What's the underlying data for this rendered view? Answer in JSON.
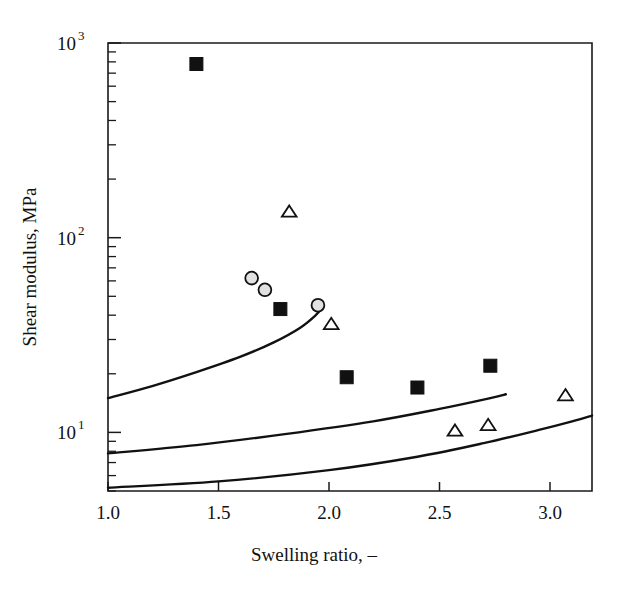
{
  "chart_data": {
    "type": "scatter",
    "title": "",
    "xlabel": "Swelling ratio, –",
    "ylabel": "Shear modulus, MPa",
    "xscale": "linear",
    "yscale": "log",
    "xlim": [
      1.0,
      3.19
    ],
    "ylim": [
      5.0,
      1000
    ],
    "grid": false,
    "legend": "none",
    "xticks": [
      {
        "value": 1.0,
        "label": "1.0"
      },
      {
        "value": 1.5,
        "label": "1.5"
      },
      {
        "value": 2.0,
        "label": "2.0"
      },
      {
        "value": 2.5,
        "label": "2.5"
      },
      {
        "value": 3.0,
        "label": "3.0"
      }
    ],
    "yticks": [
      {
        "value": 10,
        "mantissa": "10",
        "exponent": "1"
      },
      {
        "value": 100,
        "mantissa": "10",
        "exponent": "2"
      },
      {
        "value": 1000,
        "mantissa": "10",
        "exponent": "3"
      }
    ],
    "series": [
      {
        "name": "filled-squares",
        "marker": "filled-square",
        "points": [
          {
            "x": 1.4,
            "y": 780
          },
          {
            "x": 1.78,
            "y": 43
          },
          {
            "x": 2.08,
            "y": 19.2
          },
          {
            "x": 2.4,
            "y": 17.0
          },
          {
            "x": 2.73,
            "y": 22.0
          }
        ]
      },
      {
        "name": "open-circles",
        "marker": "open-circle",
        "points": [
          {
            "x": 1.65,
            "y": 62
          },
          {
            "x": 1.71,
            "y": 54
          },
          {
            "x": 1.95,
            "y": 45
          }
        ]
      },
      {
        "name": "open-triangles",
        "marker": "open-triangle",
        "points": [
          {
            "x": 1.82,
            "y": 136
          },
          {
            "x": 2.01,
            "y": 36
          },
          {
            "x": 2.57,
            "y": 10.2
          },
          {
            "x": 2.72,
            "y": 10.9
          },
          {
            "x": 3.07,
            "y": 15.5
          }
        ]
      }
    ],
    "curves": [
      {
        "name": "upper-model-curve",
        "points": [
          {
            "x": 1.0,
            "y": 15.0
          },
          {
            "x": 1.2,
            "y": 17.3
          },
          {
            "x": 1.4,
            "y": 20.4
          },
          {
            "x": 1.6,
            "y": 24.5
          },
          {
            "x": 1.75,
            "y": 29.0
          },
          {
            "x": 1.87,
            "y": 34.5
          },
          {
            "x": 1.94,
            "y": 40.0
          },
          {
            "x": 1.97,
            "y": 44.0
          }
        ]
      },
      {
        "name": "middle-model-curve",
        "points": [
          {
            "x": 1.0,
            "y": 7.8
          },
          {
            "x": 1.4,
            "y": 8.6
          },
          {
            "x": 1.8,
            "y": 9.8
          },
          {
            "x": 2.2,
            "y": 11.4
          },
          {
            "x": 2.5,
            "y": 13.2
          },
          {
            "x": 2.73,
            "y": 15.0
          },
          {
            "x": 2.8,
            "y": 15.7
          }
        ]
      },
      {
        "name": "lower-model-curve",
        "points": [
          {
            "x": 1.0,
            "y": 5.2
          },
          {
            "x": 1.5,
            "y": 5.6
          },
          {
            "x": 2.0,
            "y": 6.4
          },
          {
            "x": 2.4,
            "y": 7.5
          },
          {
            "x": 2.7,
            "y": 8.8
          },
          {
            "x": 2.95,
            "y": 10.3
          },
          {
            "x": 3.1,
            "y": 11.4
          },
          {
            "x": 3.19,
            "y": 12.2
          }
        ]
      }
    ]
  },
  "axes": {
    "x_title": "Swelling ratio, –",
    "y_title": "Shear modulus, MPa"
  }
}
